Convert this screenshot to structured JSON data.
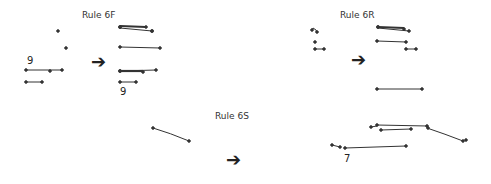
{
  "panels": [
    {
      "title": "Rule 6F",
      "before_label": "9",
      "after_label": "9"
    },
    {
      "title": "Rule 6R"
    },
    {
      "title": "Rule 6S",
      "after_label": "7"
    }
  ],
  "arrow_glyph": "➔",
  "colors": {
    "stroke": "#333333",
    "text": "#333333"
  }
}
